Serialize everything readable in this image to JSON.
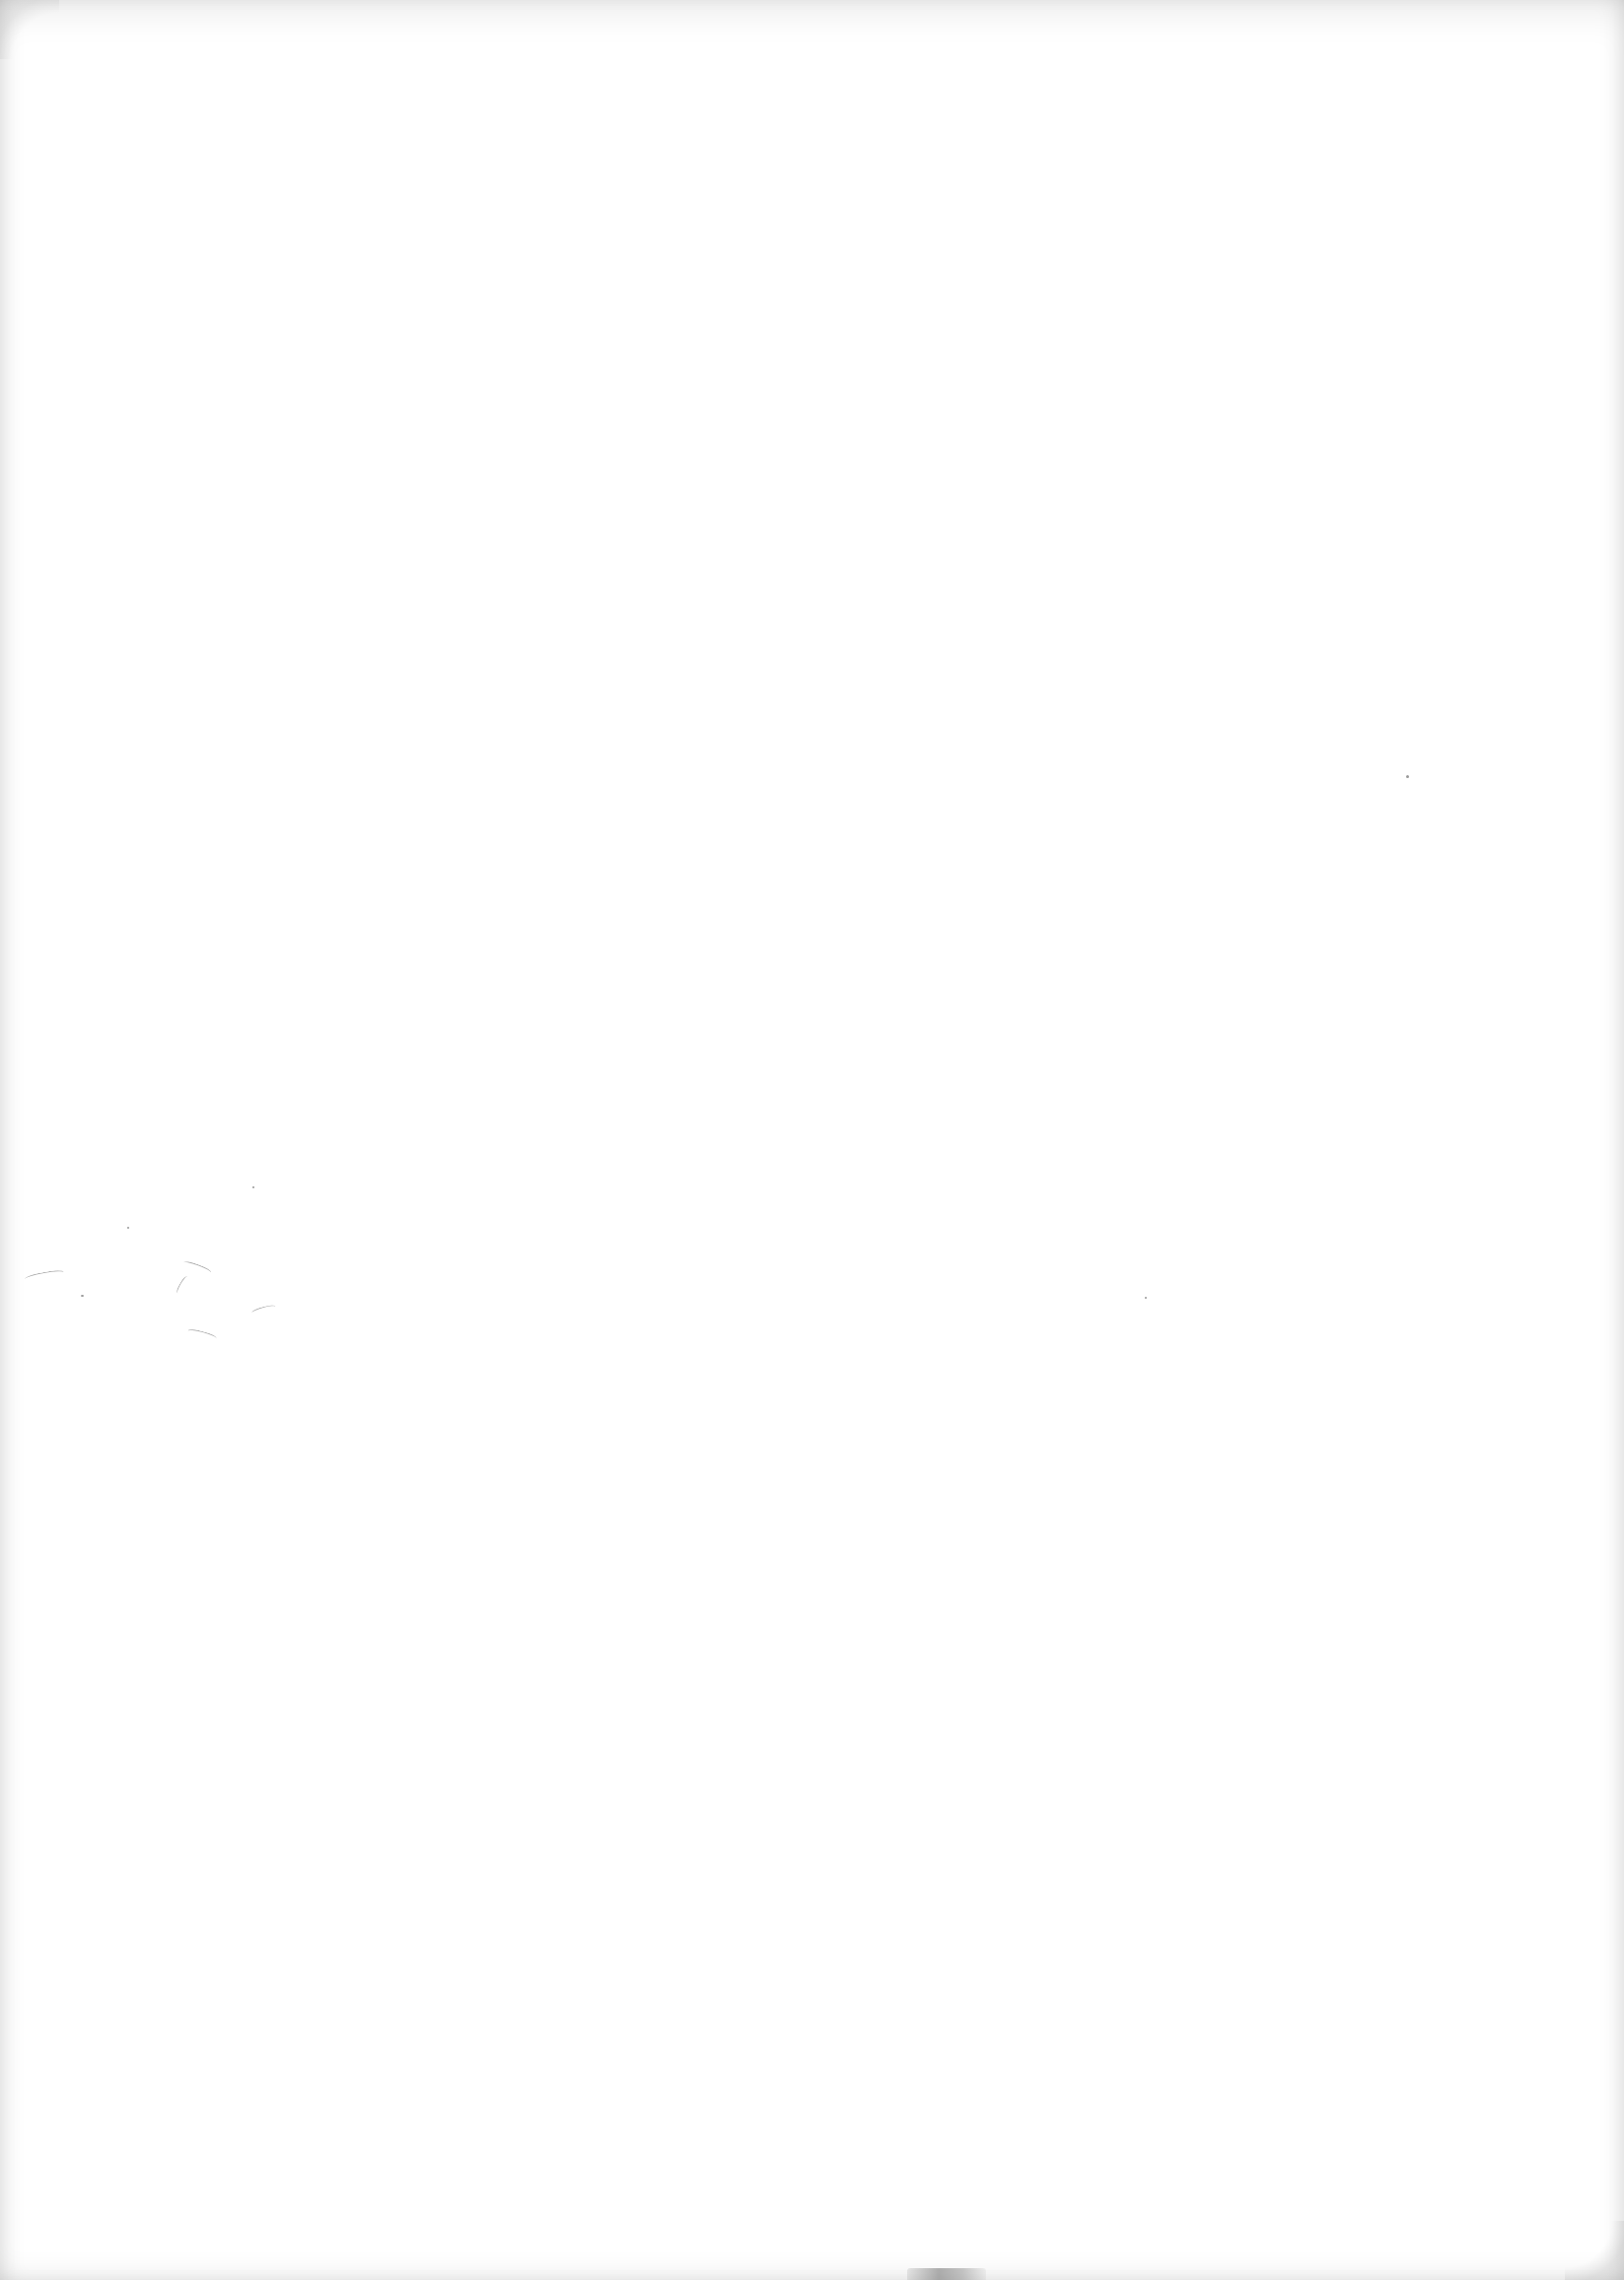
{
  "document": {
    "type": "scanned-blank-page",
    "text": "",
    "background_color": "#ffffff",
    "edge_shadow_color": "#d8d8d8"
  },
  "artifacts": {
    "specks": [
      {
        "x": 1426,
        "y": 786,
        "size": 3
      },
      {
        "x": 1161,
        "y": 1315,
        "size": 2
      },
      {
        "x": 256,
        "y": 1203,
        "size": 2
      },
      {
        "x": 129,
        "y": 1244,
        "size": 2
      },
      {
        "x": 82,
        "y": 1313,
        "size": 3
      }
    ],
    "fibers": [
      {
        "x": 25,
        "y": 1290,
        "w": 40,
        "r": -10
      },
      {
        "x": 185,
        "y": 1282,
        "w": 30,
        "r": 20
      },
      {
        "x": 255,
        "y": 1325,
        "w": 25,
        "r": -15
      },
      {
        "x": 190,
        "y": 1350,
        "w": 30,
        "r": 15
      },
      {
        "x": 175,
        "y": 1300,
        "w": 20,
        "r": -60
      }
    ]
  }
}
